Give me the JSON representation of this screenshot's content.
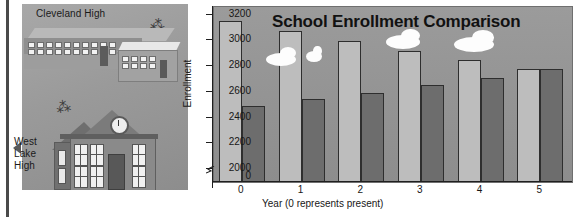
{
  "illustration": {
    "cleveland_label": "Cleveland High",
    "westlake_label": "West Lake High"
  },
  "chart_data": {
    "type": "bar",
    "title": "School Enrollment Comparison",
    "xlabel": "Year (0 represents present)",
    "ylabel": "Enrollment",
    "categories": [
      "0",
      "1",
      "2",
      "3",
      "4",
      "5"
    ],
    "ylim": [
      1900,
      3260
    ],
    "yticks": [
      2000,
      2200,
      2400,
      2600,
      2800,
      3000,
      3200
    ],
    "ytick_labels": [
      "2000",
      "2200",
      "2400",
      "2600",
      "2800",
      "3000",
      "3200"
    ],
    "zero_label": "0",
    "axis_break": true,
    "grid": false,
    "legend": false,
    "series": [
      {
        "name": "Cleveland High",
        "color": "#bdbdbd",
        "values": [
          3150,
          3070,
          2995,
          2920,
          2845,
          2775
        ]
      },
      {
        "name": "West Lake High",
        "color": "#6d6d6d",
        "values": [
          2490,
          2545,
          2590,
          2655,
          2710,
          2780
        ]
      }
    ]
  },
  "colors": {
    "plot_background": "#949494",
    "panel_background": "#9e9e9e",
    "axis": "#1f1f1f",
    "cloud": "#fdfdfd"
  }
}
